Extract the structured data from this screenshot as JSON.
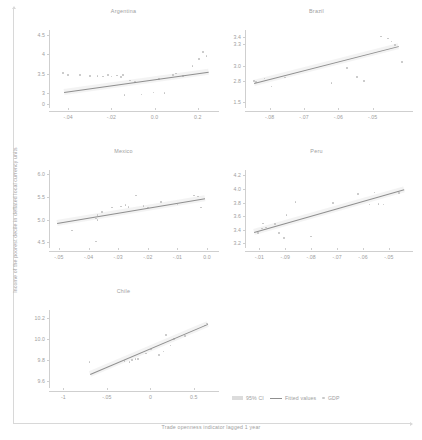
{
  "figure": {
    "xlabel": "Trade openness indicator lagged 1 year",
    "ylabel": "Income of the poorest decile in deflated local currency units"
  },
  "legend": {
    "ci_label": "95% CI",
    "fit_label": "Fitted values",
    "point_label": "GDP"
  },
  "colors": {
    "point": "#c2c2c2",
    "line": "#8f8f8f",
    "ci": "#e9e9e9",
    "text": "#9e9e9e",
    "axis": "#cfcfcf"
  },
  "chart_data": [
    {
      "type": "scatter",
      "title": "Argentina",
      "xlabel": "Trade openness indicator lagged 1 year",
      "ylabel": "Income of the poorest decile in deflated local currency units",
      "xlim": [
        -0.47,
        0.27
      ],
      "ylim": [
        2.62,
        4.62
      ],
      "xticks": [
        -0.4,
        -0.2,
        0.0,
        0.2
      ],
      "xticklabels": [
        "-.04",
        "-.02",
        "0.0",
        "0.2"
      ],
      "yticks": [
        2.72,
        3,
        3.5,
        4,
        4.5
      ],
      "yticklabels": [
        "0",
        "3",
        "3.5",
        "4",
        "4.5"
      ],
      "grid": false,
      "fit": {
        "x0": -0.42,
        "y0": 3.04,
        "x1": 0.25,
        "y1": 3.56
      },
      "points": [
        {
          "x": -0.425,
          "y": 3.52
        },
        {
          "x": -0.4,
          "y": 3.47
        },
        {
          "x": -0.345,
          "y": 3.46
        },
        {
          "x": -0.3,
          "y": 3.44
        },
        {
          "x": -0.265,
          "y": 3.44
        },
        {
          "x": -0.24,
          "y": 3.43
        },
        {
          "x": -0.215,
          "y": 3.46
        },
        {
          "x": -0.2,
          "y": 3.43
        },
        {
          "x": -0.175,
          "y": 3.45
        },
        {
          "x": -0.155,
          "y": 3.41
        },
        {
          "x": -0.145,
          "y": 3.46
        },
        {
          "x": -0.14,
          "y": 2.95
        },
        {
          "x": -0.115,
          "y": 3.32
        },
        {
          "x": -0.09,
          "y": 3.29
        },
        {
          "x": -0.06,
          "y": 2.97
        },
        {
          "x": -0.005,
          "y": 3.02
        },
        {
          "x": 0.02,
          "y": 3.36
        },
        {
          "x": 0.045,
          "y": 3.0
        },
        {
          "x": 0.085,
          "y": 3.47
        },
        {
          "x": 0.1,
          "y": 3.5
        },
        {
          "x": 0.13,
          "y": 3.44
        },
        {
          "x": 0.175,
          "y": 3.7
        },
        {
          "x": 0.205,
          "y": 3.88
        },
        {
          "x": 0.225,
          "y": 4.06
        },
        {
          "x": 0.24,
          "y": 3.95
        }
      ]
    },
    {
      "type": "scatter",
      "title": "Brazil",
      "xlabel": "Trade openness indicator lagged 1 year",
      "ylabel": "Income of the poorest decile in deflated local currency units",
      "xlim": [
        -0.86,
        -0.4
      ],
      "ylim": [
        2.42,
        3.5
      ],
      "xticks": [
        -0.8,
        -0.7,
        -0.6,
        -0.5
      ],
      "xticklabels": [
        "-.08",
        "-.07",
        "-.06",
        "-.05"
      ],
      "yticks": [
        2.5,
        2.8,
        3.0,
        3.3,
        3.4
      ],
      "yticklabels": [
        "1.5",
        "2.8",
        "3.0",
        "3.3",
        "3.4"
      ],
      "grid": false,
      "fit": {
        "x0": -0.845,
        "y0": 2.76,
        "x1": -0.425,
        "y1": 3.27
      },
      "points": [
        {
          "x": -0.845,
          "y": 2.79
        },
        {
          "x": -0.84,
          "y": 2.78
        },
        {
          "x": -0.815,
          "y": 2.83
        },
        {
          "x": -0.795,
          "y": 2.72
        },
        {
          "x": -0.755,
          "y": 2.84
        },
        {
          "x": -0.62,
          "y": 2.77
        },
        {
          "x": -0.575,
          "y": 2.97
        },
        {
          "x": -0.545,
          "y": 2.85
        },
        {
          "x": -0.525,
          "y": 2.79
        },
        {
          "x": -0.475,
          "y": 3.41
        },
        {
          "x": -0.455,
          "y": 3.38
        },
        {
          "x": -0.445,
          "y": 3.34
        },
        {
          "x": -0.435,
          "y": 3.29
        },
        {
          "x": -0.425,
          "y": 3.27
        },
        {
          "x": -0.415,
          "y": 3.06
        }
      ]
    },
    {
      "type": "scatter",
      "title": "Mexico",
      "xlabel": "Trade openness indicator lagged 1 year",
      "ylabel": "Income of the poorest decile in deflated local currency units",
      "xlim": [
        -0.52,
        0.02
      ],
      "ylim": [
        4.38,
        6.08
      ],
      "xticks": [
        -0.5,
        -0.4,
        -0.3,
        -0.2,
        -0.1,
        0.0
      ],
      "xticklabels": [
        "-.05",
        "-.04",
        "-.03",
        "-.02",
        "-.01",
        "0.0"
      ],
      "yticks": [
        4.5,
        5.0,
        5.5,
        6.0
      ],
      "yticklabels": [
        "4.5",
        "5.0",
        "5.5",
        "6.0"
      ],
      "grid": false,
      "fit": {
        "x0": -0.505,
        "y0": 4.92,
        "x1": -0.005,
        "y1": 5.46
      },
      "points": [
        {
          "x": -0.455,
          "y": 4.76
        },
        {
          "x": -0.375,
          "y": 4.52
        },
        {
          "x": -0.375,
          "y": 5.02
        },
        {
          "x": -0.37,
          "y": 4.99
        },
        {
          "x": -0.37,
          "y": 5.1
        },
        {
          "x": -0.355,
          "y": 5.17
        },
        {
          "x": -0.32,
          "y": 5.26
        },
        {
          "x": -0.29,
          "y": 5.28
        },
        {
          "x": -0.275,
          "y": 5.32
        },
        {
          "x": -0.265,
          "y": 5.27
        },
        {
          "x": -0.24,
          "y": 5.52
        },
        {
          "x": -0.215,
          "y": 5.3
        },
        {
          "x": -0.2,
          "y": 5.26
        },
        {
          "x": -0.155,
          "y": 5.38
        },
        {
          "x": -0.1,
          "y": 5.33
        },
        {
          "x": -0.045,
          "y": 5.52
        },
        {
          "x": -0.03,
          "y": 5.5
        },
        {
          "x": -0.02,
          "y": 5.26
        }
      ]
    },
    {
      "type": "scatter",
      "title": "Peru",
      "xlabel": "Trade openness indicator lagged 1 year",
      "ylabel": "Income of the poorest decile in deflated local currency units",
      "xlim": [
        -1.04,
        -0.43
      ],
      "ylim": [
        3.13,
        4.28
      ],
      "xticks": [
        -1.0,
        -0.9,
        -0.8,
        -0.7,
        -0.6,
        -0.5
      ],
      "xticklabels": [
        "-.01",
        "-.09",
        "-.08",
        "-.07",
        "-.06",
        "-.05"
      ],
      "yticks": [
        3.2,
        3.4,
        3.6,
        3.8,
        4.0,
        4.2
      ],
      "yticklabels": [
        "3.2",
        "3.4",
        "3.6",
        "3.8",
        "4.0",
        "4.2"
      ],
      "grid": false,
      "fit": {
        "x0": -1.02,
        "y0": 3.37,
        "x1": -0.44,
        "y1": 4.0
      },
      "points": [
        {
          "x": -1.005,
          "y": 3.35
        },
        {
          "x": -0.99,
          "y": 3.42
        },
        {
          "x": -0.985,
          "y": 3.49
        },
        {
          "x": -0.975,
          "y": 3.43
        },
        {
          "x": -0.94,
          "y": 3.48
        },
        {
          "x": -0.925,
          "y": 3.35
        },
        {
          "x": -0.905,
          "y": 3.28
        },
        {
          "x": -0.895,
          "y": 3.62
        },
        {
          "x": -0.86,
          "y": 3.81
        },
        {
          "x": -0.8,
          "y": 3.3
        },
        {
          "x": -0.715,
          "y": 3.79
        },
        {
          "x": -0.695,
          "y": 3.71
        },
        {
          "x": -0.62,
          "y": 3.93
        },
        {
          "x": -0.575,
          "y": 3.77
        },
        {
          "x": -0.555,
          "y": 3.95
        },
        {
          "x": -0.54,
          "y": 3.78
        },
        {
          "x": -0.52,
          "y": 3.77
        },
        {
          "x": -0.46,
          "y": 3.94
        }
      ]
    },
    {
      "type": "scatter",
      "title": "Chile",
      "xlabel": "Trade openness indicator lagged 1 year",
      "ylabel": "Income of the poorest decile in deflated local currency units",
      "xlim": [
        -1.12,
        0.72
      ],
      "ylim": [
        9.53,
        10.28
      ],
      "xticks": [
        -1,
        -0.5,
        0,
        0.5
      ],
      "xticklabels": [
        "-1",
        "-.05",
        "0",
        "0.5"
      ],
      "yticks": [
        9.6,
        9.8,
        10.0,
        10.2
      ],
      "yticklabels": [
        "9.6",
        "9.8",
        "10.0",
        "10.2"
      ],
      "grid": false,
      "fit": {
        "x0": -0.7,
        "y0": 9.66,
        "x1": 0.65,
        "y1": 10.14
      },
      "points": [
        {
          "x": -0.7,
          "y": 9.78
        },
        {
          "x": -0.3,
          "y": 9.79
        },
        {
          "x": -0.24,
          "y": 9.78
        },
        {
          "x": -0.21,
          "y": 9.8
        },
        {
          "x": -0.17,
          "y": 9.81
        },
        {
          "x": -0.14,
          "y": 9.81
        },
        {
          "x": -0.05,
          "y": 9.86
        },
        {
          "x": 0.01,
          "y": 9.9
        },
        {
          "x": 0.1,
          "y": 9.85
        },
        {
          "x": 0.15,
          "y": 9.88
        },
        {
          "x": 0.18,
          "y": 10.04
        },
        {
          "x": 0.23,
          "y": 9.94
        },
        {
          "x": 0.27,
          "y": 10.0
        },
        {
          "x": 0.4,
          "y": 10.03
        },
        {
          "x": 0.63,
          "y": 10.13
        },
        {
          "x": 0.65,
          "y": 10.15
        }
      ]
    }
  ]
}
